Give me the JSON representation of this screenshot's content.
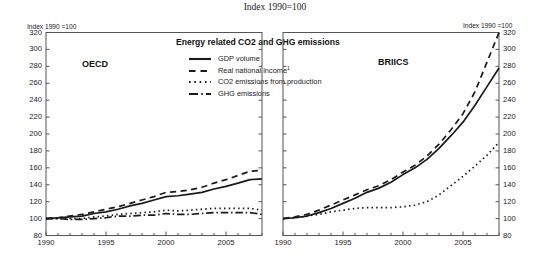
{
  "suptitle": "Index 1990=100",
  "axis_header_left": "Index 1990 =100",
  "axis_header_right": "Index 1990 =100",
  "chart_title": "Energy related CO2 and GHG emissions",
  "panels": [
    {
      "key": "oecd",
      "label": "OECD"
    },
    {
      "key": "briics",
      "label": "BRIICS"
    }
  ],
  "legend": [
    {
      "label": "GDP volume",
      "style": "solid",
      "name": "gdp-volume"
    },
    {
      "label": "Real national income",
      "style": "dashed",
      "name": "real-national-income",
      "footnote": "1"
    },
    {
      "label": "CO2 emissions from production",
      "style": "dotted",
      "name": "co2-emissions-production"
    },
    {
      "label": "GHG emissions",
      "style": "dashdot",
      "name": "ghg-emissions"
    }
  ],
  "yticks": [
    320,
    300,
    280,
    260,
    240,
    220,
    200,
    180,
    160,
    140,
    120,
    100,
    80
  ],
  "xticks": [
    1990,
    1995,
    2000,
    2005
  ],
  "colors": {
    "line": "#1a1a1a",
    "frame": "#555555",
    "background": "#ffffff"
  },
  "chart_data": {
    "type": "line",
    "title": "Energy related CO2 and GHG emissions",
    "subtitle": "Index 1990=100",
    "xlabel": "",
    "ylabel": "Index 1990 =100",
    "ylim": [
      80,
      320
    ],
    "xlim": [
      1990,
      2008
    ],
    "grid": false,
    "legend_position": "top-center",
    "x": [
      1990,
      1991,
      1992,
      1993,
      1994,
      1995,
      1996,
      1997,
      1998,
      1999,
      2000,
      2001,
      2002,
      2003,
      2004,
      2005,
      2006,
      2007,
      2008
    ],
    "panels": [
      {
        "name": "OECD",
        "series": [
          {
            "name": "GDP volume",
            "style": "solid",
            "values": [
              100,
              101,
              102,
              103,
              106,
              108,
              111,
              115,
              118,
              122,
              126,
              127,
              129,
              131,
              135,
              138,
              142,
              146,
              147
            ]
          },
          {
            "name": "Real national income",
            "style": "dashed",
            "values": [
              100,
              101,
              103,
              105,
              108,
              111,
              114,
              118,
              122,
              126,
              131,
              132,
              134,
              137,
              142,
              146,
              151,
              156,
              157
            ]
          },
          {
            "name": "CO2 emissions from production",
            "style": "dotted",
            "values": [
              100,
              100,
              100,
              100,
              102,
              103,
              105,
              106,
              107,
              108,
              110,
              109,
              110,
              111,
              112,
              112,
              112,
              112,
              110
            ]
          },
          {
            "name": "GHG emissions",
            "style": "dashdot",
            "values": [
              100,
              100,
              99,
              99,
              100,
              101,
              103,
              103,
              104,
              104,
              106,
              105,
              105,
              106,
              107,
              107,
              107,
              107,
              105
            ]
          }
        ]
      },
      {
        "name": "BRIICS",
        "series": [
          {
            "name": "GDP volume",
            "style": "solid",
            "values": [
              100,
              101,
              103,
              107,
              112,
              118,
              124,
              131,
              136,
              143,
              152,
              160,
              170,
              183,
              198,
              214,
              234,
              256,
              278
            ]
          },
          {
            "name": "Real national income",
            "style": "dashed",
            "values": [
              100,
              102,
              105,
              110,
              116,
              122,
              128,
              134,
              139,
              146,
              155,
              163,
              174,
              188,
              205,
              224,
              250,
              285,
              320
            ]
          },
          {
            "name": "CO2 emissions from production",
            "style": "dotted",
            "values": [
              100,
              101,
              103,
              105,
              108,
              110,
              112,
              113,
              113,
              113,
              114,
              116,
              120,
              128,
              139,
              150,
              162,
              175,
              190
            ]
          }
        ]
      }
    ]
  },
  "footnote_marker": "1"
}
